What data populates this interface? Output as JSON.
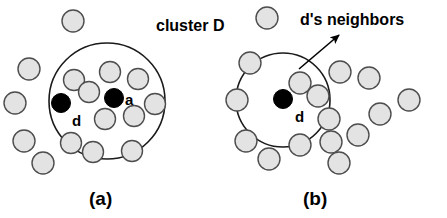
{
  "figure": {
    "title": "",
    "background_color": "#ffffff",
    "width": 447,
    "height": 218,
    "colors": {
      "node_fill": "#e3e3e3",
      "node_stroke": "#4d4d4d",
      "highlight_fill": "#000000",
      "circle_stroke": "#1a1a1a",
      "text": "#000000",
      "arrow": "#000000"
    }
  },
  "chart_data": {
    "type": "scatter",
    "title": "",
    "xlabel": "",
    "ylabel": "",
    "panels": [
      {
        "id": "a",
        "caption": "(a)",
        "caption_pos": {
          "x": 89,
          "y": 205
        },
        "boundary": {
          "label": "cluster D",
          "label_pos": {
            "x": 156,
            "y": 31
          },
          "shape": "circle",
          "cx": 107,
          "cy": 101,
          "r": 58
        },
        "points": [
          {
            "name": "a",
            "x": 114,
            "y": 98,
            "r": 9.5,
            "style": "highlight",
            "label": "a",
            "label_pos": {
              "x": 125,
              "y": 105
            }
          },
          {
            "name": "d",
            "x": 61,
            "y": 103,
            "r": 9.5,
            "style": "highlight",
            "label": "d",
            "label_pos": {
              "x": 72,
              "y": 126
            }
          },
          {
            "name": "p1",
            "x": 73,
            "y": 21,
            "r": 11,
            "style": "normal",
            "label": "",
            "label_pos": null
          },
          {
            "name": "p2",
            "x": 29,
            "y": 69,
            "r": 11,
            "style": "normal",
            "label": "",
            "label_pos": null
          },
          {
            "name": "p3",
            "x": 15,
            "y": 103,
            "r": 11,
            "style": "normal",
            "label": "",
            "label_pos": null
          },
          {
            "name": "p4",
            "x": 24,
            "y": 141,
            "r": 11,
            "style": "normal",
            "label": "",
            "label_pos": null
          },
          {
            "name": "p5",
            "x": 43,
            "y": 163,
            "r": 11,
            "style": "normal",
            "label": "",
            "label_pos": null
          },
          {
            "name": "p6",
            "x": 74,
            "y": 80,
            "r": 10.5,
            "style": "normal",
            "label": "",
            "label_pos": null
          },
          {
            "name": "p7",
            "x": 89,
            "y": 92,
            "r": 10.5,
            "style": "normal",
            "label": "",
            "label_pos": null
          },
          {
            "name": "p8",
            "x": 110,
            "y": 72,
            "r": 10.5,
            "style": "normal",
            "label": "",
            "label_pos": null
          },
          {
            "name": "p9",
            "x": 138,
            "y": 79,
            "r": 10.5,
            "style": "normal",
            "label": "",
            "label_pos": null
          },
          {
            "name": "p10",
            "x": 155,
            "y": 104,
            "r": 10.5,
            "style": "normal",
            "label": "",
            "label_pos": null
          },
          {
            "name": "p11",
            "x": 134,
            "y": 116,
            "r": 10.5,
            "style": "normal",
            "label": "",
            "label_pos": null
          },
          {
            "name": "p12",
            "x": 105,
            "y": 119,
            "r": 10.5,
            "style": "normal",
            "label": "",
            "label_pos": null
          },
          {
            "name": "p13",
            "x": 71,
            "y": 143,
            "r": 10.5,
            "style": "normal",
            "label": "",
            "label_pos": null
          },
          {
            "name": "p14",
            "x": 93,
            "y": 152,
            "r": 10.5,
            "style": "normal",
            "label": "",
            "label_pos": null
          },
          {
            "name": "p15",
            "x": 132,
            "y": 151,
            "r": 10.5,
            "style": "normal",
            "label": "",
            "label_pos": null
          }
        ],
        "annotations": []
      },
      {
        "id": "b",
        "caption": "(b)",
        "caption_pos": {
          "x": 303,
          "y": 205
        },
        "boundary": {
          "label": "",
          "label_pos": null,
          "shape": "circle",
          "cx": 283,
          "cy": 100,
          "r": 47
        },
        "points": [
          {
            "name": "d",
            "x": 283,
            "y": 99,
            "r": 9.5,
            "style": "highlight",
            "label": "d",
            "label_pos": {
              "x": 295,
              "y": 122
            }
          },
          {
            "name": "q1",
            "x": 267,
            "y": 18,
            "r": 11,
            "style": "normal",
            "label": "",
            "label_pos": null
          },
          {
            "name": "q2",
            "x": 250,
            "y": 63,
            "r": 11,
            "style": "normal",
            "label": "",
            "label_pos": null
          },
          {
            "name": "q3",
            "x": 237,
            "y": 100,
            "r": 11,
            "style": "normal",
            "label": "",
            "label_pos": null
          },
          {
            "name": "q4",
            "x": 246,
            "y": 141,
            "r": 11,
            "style": "normal",
            "label": "",
            "label_pos": null
          },
          {
            "name": "q5",
            "x": 269,
            "y": 159,
            "r": 11,
            "style": "normal",
            "label": "",
            "label_pos": null
          },
          {
            "name": "q6",
            "x": 300,
            "y": 145,
            "r": 11,
            "style": "normal",
            "label": "",
            "label_pos": null
          },
          {
            "name": "q7",
            "x": 300,
            "y": 83,
            "r": 11,
            "style": "normal",
            "label": "",
            "label_pos": null
          },
          {
            "name": "q8",
            "x": 318,
            "y": 96,
            "r": 11,
            "style": "normal",
            "label": "",
            "label_pos": null
          },
          {
            "name": "q9",
            "x": 329,
            "y": 119,
            "r": 11,
            "style": "normal",
            "label": "",
            "label_pos": null
          },
          {
            "name": "q10",
            "x": 331,
            "y": 142,
            "r": 11,
            "style": "normal",
            "label": "",
            "label_pos": null
          },
          {
            "name": "q11",
            "x": 340,
            "y": 72,
            "r": 11,
            "style": "normal",
            "label": "",
            "label_pos": null
          },
          {
            "name": "q12",
            "x": 369,
            "y": 78,
            "r": 11,
            "style": "normal",
            "label": "",
            "label_pos": null
          },
          {
            "name": "q13",
            "x": 380,
            "y": 114,
            "r": 11,
            "style": "normal",
            "label": "",
            "label_pos": null
          },
          {
            "name": "q14",
            "x": 358,
            "y": 135,
            "r": 11,
            "style": "normal",
            "label": "",
            "label_pos": null
          },
          {
            "name": "q15",
            "x": 339,
            "y": 163,
            "r": 11,
            "style": "normal",
            "label": "",
            "label_pos": null
          },
          {
            "name": "q16",
            "x": 409,
            "y": 100,
            "r": 11,
            "style": "normal",
            "label": "",
            "label_pos": null
          }
        ],
        "annotations": [
          {
            "name": "neighbors-annotation",
            "label": "d's neighbors",
            "label_pos": {
              "x": 300,
              "y": 25
            },
            "arrow": {
              "x1": 299,
              "y1": 69,
              "x2": 339,
              "y2": 35
            }
          }
        ]
      }
    ]
  }
}
